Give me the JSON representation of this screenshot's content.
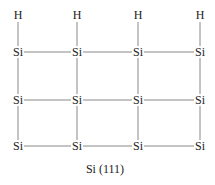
{
  "diagram": {
    "caption": "Si (111)",
    "line_color": "#888888",
    "columns_x": [
      18,
      77,
      138,
      200
    ],
    "rows": [
      {
        "y": 15,
        "atoms": [
          "H",
          "H",
          "H",
          "H"
        ]
      },
      {
        "y": 52,
        "atoms": [
          "Si",
          "Si",
          "Si",
          "Si"
        ]
      },
      {
        "y": 100,
        "atoms": [
          "Si",
          "Si",
          "Si",
          "Si"
        ]
      },
      {
        "y": 146,
        "atoms": [
          "Si",
          "Si",
          "Si",
          "Si"
        ]
      }
    ]
  }
}
